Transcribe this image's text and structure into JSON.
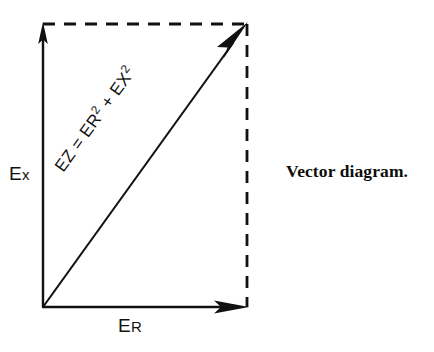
{
  "figure": {
    "type": "vector-diagram",
    "background_color": "#ffffff",
    "line_color": "#111111",
    "origin": {
      "x": 43,
      "y": 307
    },
    "corner": {
      "x": 247,
      "y": 24
    },
    "vectors": [
      {
        "name": "ex-vector",
        "label": "Ex",
        "label_main": "E",
        "label_sub": "x",
        "style": "solid",
        "arrow": true,
        "from": {
          "x": 43,
          "y": 307
        },
        "to": {
          "x": 43,
          "y": 24
        }
      },
      {
        "name": "er-vector",
        "label": "ER",
        "label_main": "E",
        "label_sub": "R",
        "style": "solid",
        "arrow": true,
        "from": {
          "x": 43,
          "y": 307
        },
        "to": {
          "x": 247,
          "y": 307
        }
      },
      {
        "name": "ez-resultant-vector",
        "label": "Ez",
        "style": "solid",
        "arrow": true,
        "from": {
          "x": 43,
          "y": 307
        },
        "to": {
          "x": 247,
          "y": 24
        }
      }
    ],
    "construction_lines": [
      {
        "name": "top-dashed-line",
        "style": "dashed",
        "from": {
          "x": 43,
          "y": 24
        },
        "to": {
          "x": 247,
          "y": 24
        }
      },
      {
        "name": "right-dashed-line",
        "style": "dashed",
        "from": {
          "x": 247,
          "y": 24
        },
        "to": {
          "x": 247,
          "y": 307
        }
      }
    ],
    "formula": {
      "text": "Ez = ER2 + Ex2",
      "parts": [
        {
          "main": "E",
          "sub": "Z"
        },
        {
          "op": " = "
        },
        {
          "main": "E",
          "sub": "R",
          "sup": "2"
        },
        {
          "op": " + "
        },
        {
          "main": "E",
          "sub": "X",
          "sup": "2"
        }
      ],
      "rotation_deg": -54.2
    }
  },
  "caption": {
    "text": "Vector diagram."
  }
}
